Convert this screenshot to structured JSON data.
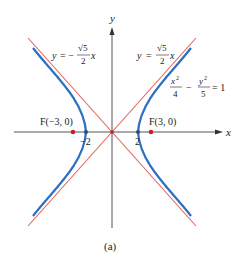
{
  "figure": {
    "caption": "(a)",
    "colors": {
      "hyperbola": "#2a6fc4",
      "asymptote": "#e0605a",
      "axis": "#555555",
      "focus": "#c8202a",
      "vertex": "#1f4e8a"
    },
    "axes": {
      "x_label": "x",
      "y_label": "y"
    },
    "equation": {
      "hyperbola": "x²/4 − y²/5 = 1",
      "num1": "x",
      "num1_exp": "2",
      "den1": "4",
      "minus": "−",
      "num2": "y",
      "num2_exp": "2",
      "den2": "5",
      "equals": "= 1"
    },
    "asymptotes": {
      "positive": {
        "text": "y = √5/2 x",
        "lhs": "y",
        "eq": "=",
        "num": "√5",
        "den": "2",
        "var": "x"
      },
      "negative": {
        "text": "y = −√5/2 x",
        "lhs": "y",
        "eq": "= −",
        "num": "√5",
        "den": "2",
        "var": "x"
      }
    },
    "foci": [
      {
        "label": "F(−3, 0)",
        "x": -3,
        "y": 0
      },
      {
        "label": "F(3, 0)",
        "x": 3,
        "y": 0
      }
    ],
    "vertices": [
      {
        "label": "−2",
        "x": -2,
        "y": 0
      },
      {
        "label": "2",
        "x": 2,
        "y": 0
      }
    ]
  }
}
